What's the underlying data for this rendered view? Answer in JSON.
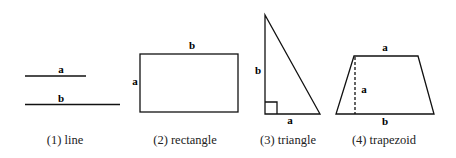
{
  "figures": [
    {
      "id": "line",
      "caption": "(1) line",
      "labels": {
        "top_line": "a",
        "bottom_line": "b"
      }
    },
    {
      "id": "rectangle",
      "caption": "(2) rectangle",
      "labels": {
        "top": "b",
        "left": "a"
      }
    },
    {
      "id": "triangle",
      "caption": "(3) triangle",
      "labels": {
        "vertical": "b",
        "base": "a"
      }
    },
    {
      "id": "trapezoid",
      "caption": "(4) trapezoid",
      "labels": {
        "top": "a",
        "height": "a",
        "base": "b"
      }
    }
  ],
  "colors": {
    "stroke": "#111111",
    "background": "#ffffff"
  }
}
